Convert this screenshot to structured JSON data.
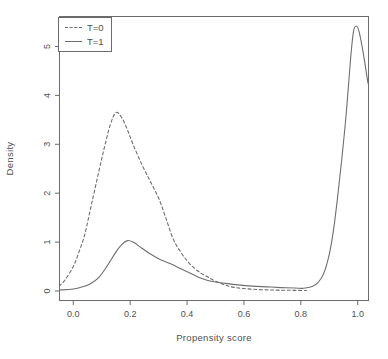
{
  "figure": {
    "background": "#ffffff",
    "axis_color": "#6b6b6b",
    "curve_color": "#6e6e6e",
    "text_color": "#4f4f4f"
  },
  "chart_data": {
    "type": "line",
    "title": "",
    "xlabel": "Propensity score",
    "ylabel": "Density",
    "xlim": [
      -0.05,
      1.04
    ],
    "ylim": [
      -0.18,
      5.62
    ],
    "grid": false,
    "x_ticks": [
      0.0,
      0.2,
      0.4,
      0.6,
      0.8,
      1.0
    ],
    "x_tick_labels": [
      "0.0",
      "0.2",
      "0.4",
      "0.6",
      "0.8",
      "1.0"
    ],
    "y_ticks": [
      0,
      1,
      2,
      3,
      4,
      5
    ],
    "y_tick_labels": [
      "0",
      "1",
      "2",
      "3",
      "4",
      "5"
    ],
    "legend": {
      "position": "topleft",
      "entries": [
        {
          "label": "T=0",
          "style": "dashed"
        },
        {
          "label": "T=1",
          "style": "solid"
        }
      ]
    },
    "series": [
      {
        "name": "T=0",
        "style": "dashed",
        "color": "#6e6e6e",
        "points": [
          [
            -0.05,
            0.1
          ],
          [
            -0.03,
            0.22
          ],
          [
            0.0,
            0.5
          ],
          [
            0.02,
            0.8
          ],
          [
            0.04,
            1.15
          ],
          [
            0.065,
            1.8
          ],
          [
            0.09,
            2.45
          ],
          [
            0.11,
            2.95
          ],
          [
            0.13,
            3.4
          ],
          [
            0.15,
            3.65
          ],
          [
            0.17,
            3.55
          ],
          [
            0.19,
            3.3
          ],
          [
            0.21,
            3.0
          ],
          [
            0.24,
            2.6
          ],
          [
            0.27,
            2.25
          ],
          [
            0.3,
            1.9
          ],
          [
            0.325,
            1.5
          ],
          [
            0.35,
            1.08
          ],
          [
            0.375,
            0.82
          ],
          [
            0.4,
            0.62
          ],
          [
            0.425,
            0.47
          ],
          [
            0.45,
            0.36
          ],
          [
            0.475,
            0.28
          ],
          [
            0.5,
            0.2
          ],
          [
            0.53,
            0.13
          ],
          [
            0.56,
            0.08
          ],
          [
            0.6,
            0.05
          ],
          [
            0.65,
            0.03
          ],
          [
            0.7,
            0.02
          ],
          [
            0.75,
            0.015
          ],
          [
            0.82,
            0.01
          ]
        ]
      },
      {
        "name": "T=1",
        "style": "solid",
        "color": "#6e6e6e",
        "points": [
          [
            -0.05,
            0.02
          ],
          [
            0.0,
            0.04
          ],
          [
            0.03,
            0.08
          ],
          [
            0.06,
            0.15
          ],
          [
            0.09,
            0.28
          ],
          [
            0.12,
            0.52
          ],
          [
            0.15,
            0.8
          ],
          [
            0.17,
            0.95
          ],
          [
            0.19,
            1.03
          ],
          [
            0.21,
            1.0
          ],
          [
            0.24,
            0.88
          ],
          [
            0.27,
            0.76
          ],
          [
            0.3,
            0.66
          ],
          [
            0.34,
            0.56
          ],
          [
            0.38,
            0.45
          ],
          [
            0.41,
            0.37
          ],
          [
            0.44,
            0.28
          ],
          [
            0.47,
            0.22
          ],
          [
            0.5,
            0.185
          ],
          [
            0.53,
            0.16
          ],
          [
            0.58,
            0.125
          ],
          [
            0.63,
            0.1
          ],
          [
            0.68,
            0.085
          ],
          [
            0.73,
            0.07
          ],
          [
            0.78,
            0.06
          ],
          [
            0.81,
            0.055
          ],
          [
            0.84,
            0.09
          ],
          [
            0.86,
            0.17
          ],
          [
            0.88,
            0.35
          ],
          [
            0.9,
            0.75
          ],
          [
            0.915,
            1.25
          ],
          [
            0.93,
            1.95
          ],
          [
            0.945,
            2.75
          ],
          [
            0.96,
            3.65
          ],
          [
            0.975,
            4.75
          ],
          [
            0.985,
            5.3
          ],
          [
            0.995,
            5.42
          ],
          [
            1.005,
            5.3
          ],
          [
            1.02,
            4.85
          ],
          [
            1.036,
            4.25
          ]
        ]
      }
    ]
  }
}
